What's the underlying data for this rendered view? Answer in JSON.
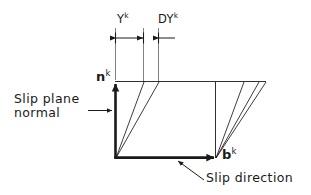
{
  "figure": {
    "type": "technical-line-diagram",
    "background_color": "#ffffff",
    "line_color": "#1a1a1a",
    "text_color": "#1a1a1a"
  },
  "annotations": {
    "slip_plane_normal": "Slip plane\nnormal",
    "slip_direction": "Slip direction"
  },
  "dimensions": {
    "gamma": {
      "base": "Y",
      "superscript": "k"
    },
    "delta_gamma": {
      "base": "DY",
      "superscript": "k"
    }
  },
  "vectors": {
    "normal": {
      "base": "n",
      "superscript": "k",
      "direction": "up"
    },
    "burgers": {
      "base": "b",
      "superscript": "k",
      "direction": "right"
    }
  },
  "icons": {
    "arrow_up": "arrow-up-icon",
    "arrow_right": "arrow-right-icon",
    "leader_arrow": "leader-arrow-icon",
    "dimension_arrow": "dimension-arrow-icon"
  }
}
